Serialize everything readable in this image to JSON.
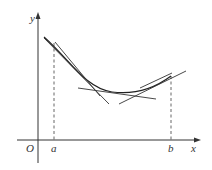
{
  "diagram": {
    "axis_labels": {
      "x": "x",
      "y": "y",
      "origin": "O"
    },
    "interval_labels": {
      "a": "a",
      "b": "b"
    },
    "colors": {
      "stroke": "#333333",
      "dashed": "#555555",
      "background": "#ffffff"
    },
    "elements": {
      "curve": "convex curve y=f(x) over [a,b]",
      "tangent_lines": 4,
      "vertical_dashed_lines": [
        "x=a",
        "x=b"
      ]
    }
  }
}
